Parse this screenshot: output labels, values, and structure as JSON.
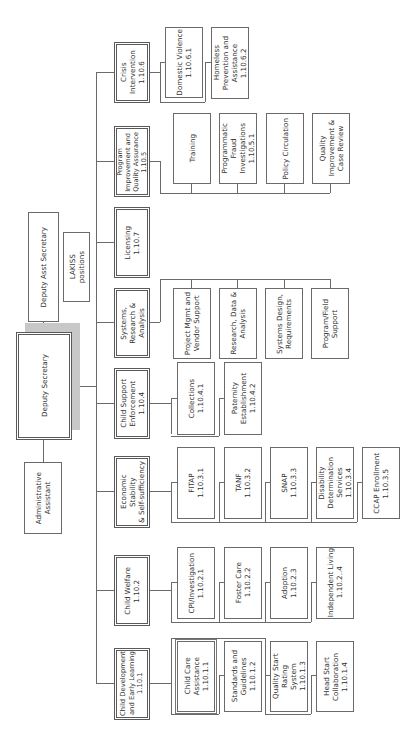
{
  "diagram": {
    "type": "org-chart",
    "orientation": "rotated-90-ccw",
    "top": {
      "deputy_secretary": "Deputy Secretary",
      "deputy_asst_secretary": "Deputy Asst Secretary",
      "lakiss": "LAKISS\npositions",
      "admin_assistant": "Administrative\nAssistant"
    },
    "divisions": [
      {
        "id": "crisis",
        "label": "Crisis Intervention\n1.10.6",
        "children": [
          "Domestic Violence\n1.10.6.1",
          "Homeless\nPrevention and\nAssistance\n1.10.6.2"
        ]
      },
      {
        "id": "piqa",
        "label": "Program\nImprovement and\nQuality Assurance\n1.10.5",
        "children": [
          "Training",
          "Programmatic\nFraud\nInvestigations\n1.10.5.1",
          "Policy Circulation",
          "Quality\nImprovement &\nCase Review"
        ]
      },
      {
        "id": "licensing",
        "label": "Licensing\n1.10.7",
        "children": []
      },
      {
        "id": "systems",
        "label": "Systems,\nResearch &\nAnalysis",
        "children": [
          "Project Mgmt and\nVendor Support",
          "Research, Data &\nAnalysis",
          "Systems Design,\nRequirements",
          "Program/Field\nSupport"
        ]
      },
      {
        "id": "cse",
        "label": "Child Support\nEnforcement\n1.10.4",
        "children": [
          "Collections\n1.10.4.1",
          "Paternity\nEstablishment\n1.10.4.2"
        ]
      },
      {
        "id": "ess",
        "label": "Economic Stability\n& Self-sufficiency",
        "children": [
          "FITAP\n1.10.3.1",
          "TANF\n1.10.3.2",
          "SNAP\n1.10.3.3",
          "Disability\nDetermination\nServices\n1.10.3.4",
          "CCAP Enrollment\n1.10.3.5"
        ]
      },
      {
        "id": "cw",
        "label": "Child Welfare\n1.10.2",
        "children": [
          "CPI/Investigation\n1.10.2.1",
          "Foster Care\n1.10.2.2",
          "Adoption\n1.10.2.3",
          "Independent Living\n1.10.2..4"
        ]
      },
      {
        "id": "cdel",
        "label": "Child Development\nand Early Learning\n1.10.1",
        "children": [
          "Child Care\nAssistance\n1.10.1.1",
          "Standards and\nGuidelines\n1.10.1.2",
          "Quality Start Rating\nSystem\n1.10.1.3",
          "Head Start\nCollaboration\n1.10.1.4"
        ]
      }
    ]
  }
}
